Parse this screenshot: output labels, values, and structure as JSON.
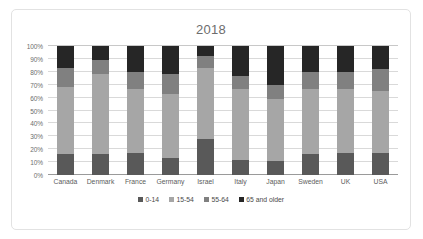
{
  "chart_data": {
    "type": "bar",
    "subtype": "stacked-100-percent",
    "title": "2018",
    "xlabel": "",
    "ylabel": "",
    "ylim": [
      0,
      100
    ],
    "yticks": [
      "0%",
      "10%",
      "20%",
      "30%",
      "40%",
      "50%",
      "60%",
      "70%",
      "80%",
      "90%",
      "100%"
    ],
    "grid": true,
    "legend_position": "bottom",
    "categories": [
      "Canada",
      "Denmark",
      "France",
      "Germany",
      "Israel",
      "Italy",
      "Japan",
      "Sweden",
      "UK",
      "USA"
    ],
    "series": [
      {
        "name": "0-14",
        "color": "#595959",
        "values": [
          16,
          16,
          17,
          13,
          28,
          12,
          11,
          16,
          17,
          17
        ]
      },
      {
        "name": "15-54",
        "color": "#a6a6a6",
        "values": [
          52,
          62,
          50,
          50,
          55,
          55,
          48,
          51,
          50,
          48
        ]
      },
      {
        "name": "55-64",
        "color": "#808080",
        "values": [
          15,
          11,
          13,
          15,
          9,
          10,
          11,
          13,
          13,
          17
        ]
      },
      {
        "name": "65 and older",
        "color": "#262626",
        "values": [
          17,
          11,
          20,
          22,
          8,
          23,
          30,
          20,
          20,
          18
        ]
      }
    ]
  }
}
